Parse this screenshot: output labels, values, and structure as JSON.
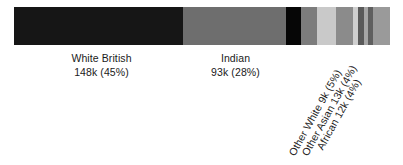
{
  "chart_data": {
    "type": "bar",
    "orientation": "horizontal-stacked",
    "title": "",
    "subtitle": "",
    "xlabel": "",
    "ylabel": "",
    "grid": false,
    "legend": "none",
    "axis_visible": false,
    "total_label": "",
    "categories": [
      "White British",
      "Indian",
      "Other White",
      "Other Asian",
      "African",
      "Remainder A",
      "Remainder B",
      "Remainder C",
      "Remainder D",
      "Remainder E",
      "Remainder F"
    ],
    "values": [
      148,
      93,
      9,
      13,
      12,
      6,
      4,
      5,
      3,
      4,
      3
    ],
    "percents": [
      45,
      28,
      5,
      4,
      4,
      2,
      1,
      2,
      1,
      1,
      1
    ],
    "units": "thousands of people",
    "segments": [
      {
        "name": "White British",
        "count_label": "148k",
        "percent_label": "(45%)",
        "label_line1": "White British",
        "label_line2": "148k (45%)",
        "width_pct": 44.9,
        "color": "#161616",
        "label_style": "horizontal"
      },
      {
        "name": "Indian",
        "count_label": "93k",
        "percent_label": "(28%)",
        "label_line1": "Indian",
        "label_line2": "93k (28%)",
        "width_pct": 27.4,
        "color": "#6e6e6e",
        "label_style": "horizontal"
      },
      {
        "name": "Other White",
        "count_label": "9k",
        "percent_label": "(5%)",
        "label_rotated": "Other White 9k (5%)",
        "width_pct": 4.0,
        "color": "#060606",
        "label_style": "rotated"
      },
      {
        "name": "Other Asian",
        "count_label": "13k",
        "percent_label": "(4%)",
        "label_rotated": "Other Asian 13k (4%)",
        "width_pct": 4.3,
        "color": "#7c7c7c",
        "label_style": "rotated"
      },
      {
        "name": "African",
        "count_label": "12k",
        "percent_label": "(4%)",
        "label_rotated": "African 12k (4%)",
        "width_pct": 5.1,
        "color": "#c9c9c9",
        "label_style": "rotated"
      },
      {
        "name": "Remainder A",
        "label_rotated": "",
        "width_pct": 4.5,
        "color": "#8b8b8b",
        "label_style": "none"
      },
      {
        "name": "Remainder B",
        "label_rotated": "",
        "width_pct": 1.3,
        "color": "#cfcfcf",
        "label_style": "none"
      },
      {
        "name": "Remainder C",
        "label_rotated": "",
        "width_pct": 1.6,
        "color": "#5a5a5a",
        "label_style": "none"
      },
      {
        "name": "Remainder D",
        "label_rotated": "",
        "width_pct": 1.1,
        "color": "#a6a6a6",
        "label_style": "none"
      },
      {
        "name": "Remainder E",
        "label_rotated": "",
        "width_pct": 1.3,
        "color": "#5f5f5f",
        "label_style": "none"
      },
      {
        "name": "Remainder F",
        "label_rotated": "",
        "width_pct": 4.5,
        "color": "#9a9a9a",
        "label_style": "none"
      }
    ]
  },
  "figure": {
    "background": "#ffffff",
    "text_color": "#1a1a1a"
  }
}
